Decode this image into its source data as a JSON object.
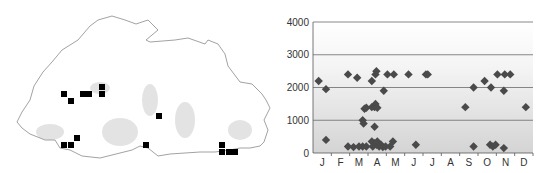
{
  "map": {
    "title": "",
    "outline_color": "#8a8a8a",
    "marker_color": "#000000",
    "markers": [
      [
        64,
        94
      ],
      [
        71,
        101
      ],
      [
        83,
        94
      ],
      [
        89,
        94
      ],
      [
        102,
        87
      ],
      [
        102,
        94
      ],
      [
        77,
        138
      ],
      [
        64,
        145
      ],
      [
        71,
        145
      ],
      [
        159,
        116
      ],
      [
        146,
        145
      ],
      [
        222,
        145
      ],
      [
        222,
        152
      ],
      [
        229,
        152
      ],
      [
        235,
        152
      ]
    ]
  },
  "chart_data": {
    "type": "scatter",
    "title": "",
    "xlabel": "",
    "ylabel": "",
    "categories": [
      "J",
      "F",
      "M",
      "A",
      "M",
      "J",
      "J",
      "A",
      "S",
      "O",
      "N",
      "D"
    ],
    "ylim": [
      0,
      4000
    ],
    "yticks": [
      0,
      1000,
      2000,
      3000,
      4000
    ],
    "grid": true,
    "legend": null,
    "marker": "diamond",
    "marker_color": "#4a4a4a",
    "points": [
      {
        "x": 0.2,
        "y": 2200
      },
      {
        "x": 0.6,
        "y": 1950
      },
      {
        "x": 0.6,
        "y": 400
      },
      {
        "x": 1.8,
        "y": 2400
      },
      {
        "x": 1.8,
        "y": 200
      },
      {
        "x": 2.1,
        "y": 180
      },
      {
        "x": 2.3,
        "y": 2300
      },
      {
        "x": 2.4,
        "y": 200
      },
      {
        "x": 2.7,
        "y": 1350
      },
      {
        "x": 2.6,
        "y": 1000
      },
      {
        "x": 2.65,
        "y": 900
      },
      {
        "x": 2.6,
        "y": 200
      },
      {
        "x": 2.8,
        "y": 200
      },
      {
        "x": 2.8,
        "y": 1380
      },
      {
        "x": 3.1,
        "y": 2200
      },
      {
        "x": 3.1,
        "y": 1400
      },
      {
        "x": 3.25,
        "y": 1400
      },
      {
        "x": 3.3,
        "y": 1500
      },
      {
        "x": 3.4,
        "y": 1380
      },
      {
        "x": 3.25,
        "y": 800
      },
      {
        "x": 3.3,
        "y": 2400
      },
      {
        "x": 3.35,
        "y": 2500
      },
      {
        "x": 3.1,
        "y": 350
      },
      {
        "x": 3.15,
        "y": 200
      },
      {
        "x": 3.25,
        "y": 300
      },
      {
        "x": 3.35,
        "y": 250
      },
      {
        "x": 3.4,
        "y": 350
      },
      {
        "x": 3.5,
        "y": 200
      },
      {
        "x": 3.6,
        "y": 250
      },
      {
        "x": 3.7,
        "y": 180
      },
      {
        "x": 3.85,
        "y": 200
      },
      {
        "x": 3.75,
        "y": 1900
      },
      {
        "x": 3.95,
        "y": 2400
      },
      {
        "x": 4.3,
        "y": 2400
      },
      {
        "x": 4.25,
        "y": 350
      },
      {
        "x": 4.1,
        "y": 200
      },
      {
        "x": 5.1,
        "y": 2400
      },
      {
        "x": 5.5,
        "y": 250
      },
      {
        "x": 6.05,
        "y": 2400
      },
      {
        "x": 6.15,
        "y": 2400
      },
      {
        "x": 8.2,
        "y": 1400
      },
      {
        "x": 8.65,
        "y": 2000
      },
      {
        "x": 8.65,
        "y": 200
      },
      {
        "x": 9.25,
        "y": 2200
      },
      {
        "x": 9.6,
        "y": 2000
      },
      {
        "x": 9.55,
        "y": 250
      },
      {
        "x": 9.7,
        "y": 200
      },
      {
        "x": 9.85,
        "y": 250
      },
      {
        "x": 9.95,
        "y": 2400
      },
      {
        "x": 10.3,
        "y": 1900
      },
      {
        "x": 10.3,
        "y": 150
      },
      {
        "x": 10.35,
        "y": 2400
      },
      {
        "x": 10.65,
        "y": 2400
      },
      {
        "x": 11.5,
        "y": 1400
      }
    ]
  }
}
